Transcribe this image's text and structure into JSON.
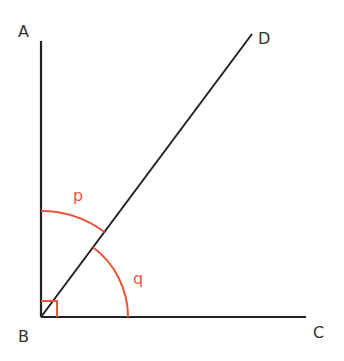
{
  "diagram": {
    "colors": {
      "line": "#222222",
      "angle_mark": "#e8553b",
      "label": "#333333",
      "background": "#ffffff"
    },
    "points": {
      "A": {
        "label": "A",
        "x": 41,
        "y": 41
      },
      "B": {
        "label": "B",
        "x": 41,
        "y": 317
      },
      "C": {
        "label": "C",
        "x": 306,
        "y": 317
      },
      "D": {
        "label": "D",
        "x": 252,
        "y": 34
      }
    },
    "segments": [
      {
        "name": "BA",
        "from": "B",
        "to": "A"
      },
      {
        "name": "BC",
        "from": "B",
        "to": "C"
      },
      {
        "name": "BD",
        "from": "B",
        "to": "D"
      }
    ],
    "angles": {
      "p": {
        "label": "p",
        "between": [
          "BA",
          "BD"
        ],
        "radius": 106
      },
      "q": {
        "label": "q",
        "between": [
          "BD",
          "BC"
        ],
        "radius": 87
      },
      "right_angle": {
        "at": "B",
        "between": [
          "BA",
          "BC"
        ],
        "size": 16
      }
    }
  }
}
